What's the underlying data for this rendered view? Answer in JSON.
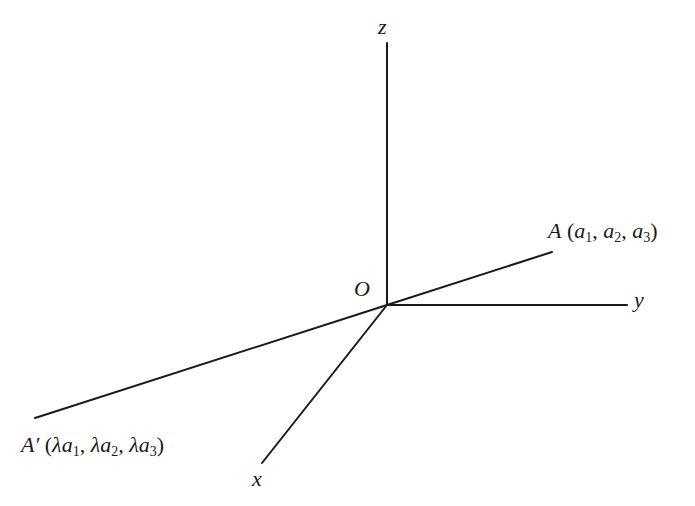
{
  "figure": {
    "type": "3d-coordinate-axes",
    "background": "#ffffff",
    "line_color": "#1a1a1a",
    "origin": {
      "label": "O",
      "x": 387,
      "y": 305
    },
    "axes": [
      {
        "name": "z",
        "label": "z",
        "x1": 387,
        "y1": 305,
        "x2": 387,
        "y2": 43
      },
      {
        "name": "y",
        "label": "y",
        "x1": 387,
        "y1": 305,
        "x2": 627,
        "y2": 305
      },
      {
        "name": "x",
        "label": "x",
        "x1": 387,
        "y1": 305,
        "x2": 262,
        "y2": 463
      }
    ],
    "lines": [
      {
        "name": "line-OA",
        "x1": 387,
        "y1": 305,
        "x2": 552,
        "y2": 252
      },
      {
        "name": "line-OA-prime",
        "x1": 387,
        "y1": 305,
        "x2": 35,
        "y2": 418
      }
    ],
    "points": {
      "A": {
        "name": "A",
        "coords": "(a1, a2, a3)",
        "label_text": "A (a₁, a₂, a₃)"
      },
      "A_prime": {
        "name": "A′",
        "coords": "(λa1, λa2, λa3)",
        "label_text": "A′ (λa₁, λa₂, λa₃)"
      }
    }
  },
  "labels": {
    "z": "z",
    "y": "y",
    "x": "x",
    "origin": "O",
    "A_name": "A",
    "A_open": " (",
    "A_a": "a",
    "A_s1": "1",
    "A_s2": "2",
    "A_s3": "3",
    "comma": ", ",
    "close": ")",
    "Ap_name": "A′",
    "lambda": "λ"
  }
}
